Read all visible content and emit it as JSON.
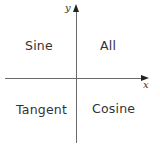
{
  "axes": {
    "x_label": "x",
    "y_label": "y"
  },
  "quadrants": {
    "q1": "All",
    "q2": "Sine",
    "q3": "Tangent",
    "q4": "Cosine"
  },
  "colors": {
    "axis": "#6a6a6a",
    "text": "#333333",
    "background": "#ffffff"
  }
}
